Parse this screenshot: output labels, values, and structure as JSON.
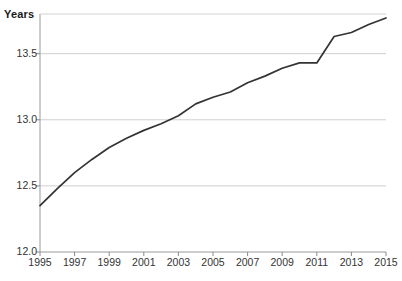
{
  "chart_data": {
    "type": "line",
    "title": "",
    "subtitle": "",
    "ylabel": "Years",
    "xlabel": "",
    "legend": [],
    "legend_position": "none",
    "grid": "horizontal",
    "xlim": [
      1995,
      2015
    ],
    "ylim": [
      12.0,
      13.8
    ],
    "yticks": [
      "12.0",
      "12.5",
      "13.0",
      "13.5"
    ],
    "ytick_values": [
      12.0,
      12.5,
      13.0,
      13.5
    ],
    "xticks": [
      "1995",
      "1997",
      "1999",
      "2001",
      "2003",
      "2005",
      "2007",
      "2009",
      "2011",
      "2013",
      "2015"
    ],
    "xtick_values": [
      1995,
      1997,
      1999,
      2001,
      2003,
      2005,
      2007,
      2009,
      2011,
      2013,
      2015
    ],
    "series": [
      {
        "name": "Years",
        "color": "#333333",
        "x": [
          1995,
          1996,
          1997,
          1998,
          1999,
          2000,
          2001,
          2002,
          2003,
          2004,
          2005,
          2006,
          2007,
          2008,
          2009,
          2010,
          2011,
          2012,
          2013,
          2014,
          2015
        ],
        "values": [
          12.35,
          12.48,
          12.6,
          12.7,
          12.79,
          12.86,
          12.92,
          12.97,
          13.03,
          13.12,
          13.17,
          13.21,
          13.28,
          13.33,
          13.39,
          13.43,
          13.43,
          13.63,
          13.66,
          13.72,
          13.77
        ]
      }
    ]
  },
  "axes": {
    "ylabel": "Years"
  },
  "colors": {
    "line": "#333333",
    "grid": "#cfcfcf",
    "axis": "#8a8a8a",
    "text": "#333333"
  }
}
